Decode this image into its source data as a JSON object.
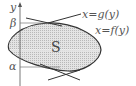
{
  "diagram": {
    "axis": {
      "label": "y"
    },
    "levels": {
      "beta": "β",
      "alpha": "α"
    },
    "region": {
      "label": "S",
      "fill": "#d9d9d9",
      "stroke": "#333333"
    },
    "curves": {
      "g": "x=g(y)",
      "f": "x=f(y)"
    },
    "colors": {
      "line": "#333333",
      "thin": "#777777",
      "dotted": "#ffffff"
    }
  }
}
